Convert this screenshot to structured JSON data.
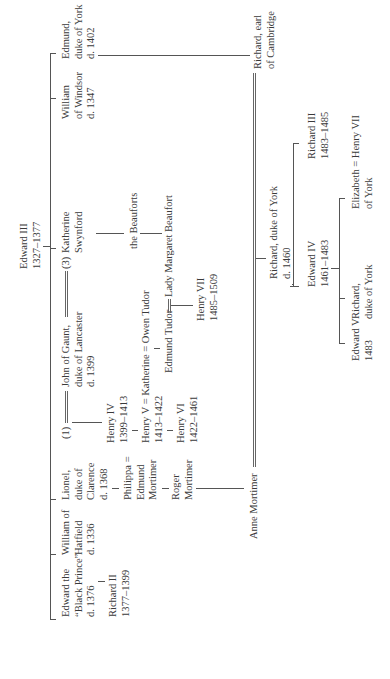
{
  "root": {
    "name": "Edward III",
    "dates": "1327–1377"
  },
  "children": [
    {
      "lines": [
        "Edward the",
        "“Black Prince”",
        "d. 1376"
      ]
    },
    {
      "lines": [
        "William of",
        "Hatfield",
        "d. 1336"
      ]
    },
    {
      "lines": [
        "Lionel,",
        "duke of",
        "Clarence",
        "d. 1368"
      ]
    },
    {
      "lines": [
        "John of Gaunt,",
        "duke of Lancaster",
        "d. 1399"
      ]
    },
    {
      "lines": [
        "William",
        "of Windsor",
        "d. 1347"
      ]
    },
    {
      "lines": [
        "Edmund,",
        "duke of York",
        "d. 1402"
      ]
    }
  ],
  "gaunt_marriages": {
    "first_marker": "(1)",
    "third_marker": "(3)",
    "third_wife": [
      "Katherine",
      "Swynford"
    ]
  },
  "people": {
    "richard_ii": [
      "Richard II",
      "1377–1399"
    ],
    "philippa": [
      "Philippa =",
      "Edmund",
      "Mortimer"
    ],
    "roger_mortimer": [
      "Roger",
      "Mortimer"
    ],
    "anne_mortimer": "Anne Mortimer",
    "henry_iv": [
      "Henry IV",
      "1399–1413"
    ],
    "henry_v": [
      "Henry V = Katherine = Owen Tudor",
      "1413–1422"
    ],
    "henry_vi": [
      "Henry VI",
      "1422–1461"
    ],
    "edmund_tudor": "Edmund Tudor",
    "beauforts": "the Beauforts",
    "lady_margaret": "Lady Margaret Beaufort",
    "henry_vii": [
      "Henry VII",
      "1485–1509"
    ],
    "richard_cambridge": [
      "Richard, earl",
      "of Cambridge"
    ],
    "richard_york": [
      "Richard, duke of York",
      "d. 1460"
    ],
    "edward_iv": [
      "Edward IV",
      "1461–1483"
    ],
    "richard_iii": [
      "Richard III",
      "1483–1485"
    ],
    "edward_v": [
      "Edward V",
      "1483"
    ],
    "richard_york_younger": [
      "Richard,",
      "duke of York"
    ],
    "elizabeth_york": [
      "Elizabeth = Henry VII",
      "of York"
    ]
  },
  "colors": {
    "line": "#555555",
    "text": "#3a3a3a",
    "background": "#ffffff"
  }
}
